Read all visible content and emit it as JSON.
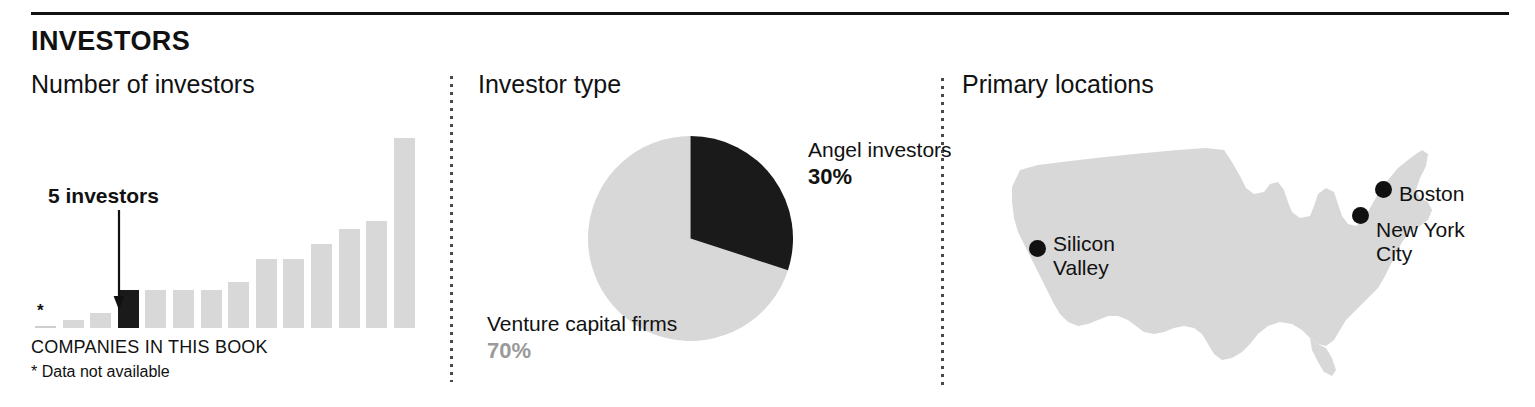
{
  "section": {
    "kicker": "INVESTORS"
  },
  "panels": {
    "bars": {
      "title": "Number of investors",
      "axis_caption": "COMPANIES IN THIS BOOK",
      "footnote": "* Data not available",
      "no_data_marker": "*",
      "callout": {
        "label": "5 investors",
        "points_to_index": 3,
        "arrow_icon": "down-arrow-icon"
      }
    },
    "pie": {
      "title": "Investor type"
    },
    "map": {
      "title": "Primary locations"
    }
  },
  "chart_data": [
    {
      "type": "bar",
      "title": "Number of investors",
      "xlabel": "COMPANIES IN THIS BOOK",
      "ylabel": "",
      "grid": false,
      "ylim": [
        0,
        26
      ],
      "categories": [
        "1",
        "2",
        "3",
        "4",
        "5",
        "6",
        "7",
        "8",
        "9",
        "10",
        "11",
        "12",
        "13",
        "14"
      ],
      "values": [
        null,
        1,
        2,
        5,
        5,
        5,
        5,
        6,
        9,
        9,
        11,
        13,
        14,
        25
      ],
      "highlight_index": 3,
      "colors": {
        "bar": "#d8d8d8",
        "highlight": "#1a1a1a"
      },
      "notes": "First column has no bar; marked with an asterisk for missing data."
    },
    {
      "type": "pie",
      "title": "Investor type",
      "legend": "labels-outside",
      "slices": [
        {
          "label": "Angel investors",
          "value": 30,
          "value_text": "30%",
          "color": "#1a1a1a"
        },
        {
          "label": "Venture capital firms",
          "value": 70,
          "value_text": "70%",
          "color": "#d8d8d8"
        }
      ]
    },
    {
      "type": "map",
      "title": "Primary locations",
      "region": "United States",
      "markers": [
        {
          "label": "Silicon Valley",
          "lines": [
            "Silicon",
            "Valley"
          ]
        },
        {
          "label": "Boston",
          "lines": [
            "Boston"
          ]
        },
        {
          "label": "New York City",
          "lines": [
            "New York",
            "City"
          ]
        }
      ],
      "colors": {
        "land": "#d8d8d8",
        "marker": "#111111"
      }
    }
  ]
}
